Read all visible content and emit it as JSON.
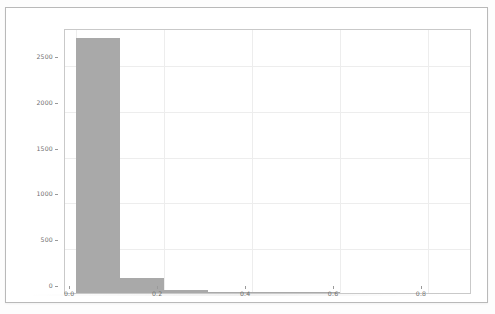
{
  "figure": {
    "background_color": "#ffffff",
    "frame_color": "#b9b9b9",
    "axes_color": "#c9c9c9",
    "grid_color": "#ededed",
    "bar_color": "#a9a9a9",
    "tick_text_color": "#6f6f6f"
  },
  "chart_data": {
    "type": "bar",
    "title": "",
    "subtitle": "",
    "xlabel": "",
    "ylabel": "",
    "legend": [],
    "grid": true,
    "legend_position": "none",
    "xlim": [
      -0.0255,
      0.9
    ],
    "ylim": [
      0,
      2894
    ],
    "xticks": [
      0.0,
      0.2,
      0.4,
      0.6,
      0.8
    ],
    "xtick_labels": [
      "0.0",
      "0.2",
      "0.4",
      "0.6",
      "0.8"
    ],
    "yticks": [
      0,
      500,
      1000,
      1500,
      2000,
      2500
    ],
    "ytick_labels": [
      "0",
      "500",
      "1000",
      "1500",
      "2000",
      "2500"
    ],
    "bin_edges": [
      0.0,
      0.1,
      0.2,
      0.3,
      0.4,
      0.5,
      0.6,
      0.7,
      0.8,
      0.9
    ],
    "categories": [
      "0.0-0.1",
      "0.1-0.2",
      "0.2-0.3",
      "0.3-0.4",
      "0.4-0.5",
      "0.5-0.6",
      "0.6-0.7",
      "0.7-0.8",
      "0.8-0.9"
    ],
    "values": [
      2790,
      160,
      28,
      8,
      2,
      1,
      0,
      0,
      0
    ],
    "bars": [
      {
        "x0": 0.0,
        "x1": 0.1,
        "value": 2790
      },
      {
        "x0": 0.1,
        "x1": 0.2,
        "value": 160
      },
      {
        "x0": 0.2,
        "x1": 0.3,
        "value": 28
      },
      {
        "x0": 0.3,
        "x1": 0.4,
        "value": 8
      },
      {
        "x0": 0.4,
        "x1": 0.5,
        "value": 2
      },
      {
        "x0": 0.5,
        "x1": 0.6,
        "value": 1
      },
      {
        "x0": 0.6,
        "x1": 0.7,
        "value": 0
      },
      {
        "x0": 0.7,
        "x1": 0.8,
        "value": 0
      },
      {
        "x0": 0.8,
        "x1": 0.9,
        "value": 0
      }
    ]
  }
}
